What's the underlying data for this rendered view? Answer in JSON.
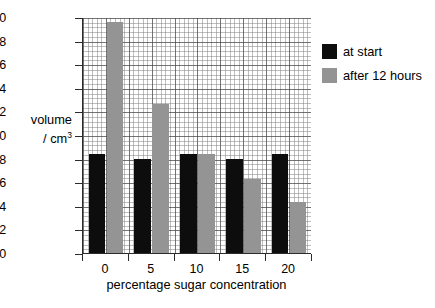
{
  "chart_data": {
    "type": "bar",
    "title": "",
    "xlabel": "percentage sugar concentration",
    "ylabel": "volume / cm3",
    "ylabel_main": "volume",
    "ylabel_unit": "/ cm",
    "ylabel_unit_sup": "3",
    "categories": [
      "0",
      "5",
      "10",
      "15",
      "20"
    ],
    "series": [
      {
        "name": "at start",
        "color": "#0d0d0d",
        "values": [
          8.4,
          8.0,
          8.4,
          8.0,
          8.4
        ]
      },
      {
        "name": "after 12 hours",
        "color": "#949494",
        "values": [
          19.6,
          12.6,
          8.4,
          6.3,
          4.3
        ]
      }
    ],
    "ylim": [
      0,
      20
    ],
    "ytick_step": 2,
    "yticks": [
      "20",
      "18",
      "16",
      "14",
      "12",
      "10",
      "8",
      "6",
      "4",
      "2",
      "0"
    ],
    "xticks": [
      "0",
      "5",
      "10",
      "15",
      "20"
    ],
    "grid": "graph-paper-minor-and-major",
    "legend_position": "right-top"
  },
  "legend": {
    "items": [
      {
        "label": "at start",
        "swatch": "black-swatch"
      },
      {
        "label": "after 12 hours",
        "swatch": "gray-swatch"
      }
    ]
  }
}
